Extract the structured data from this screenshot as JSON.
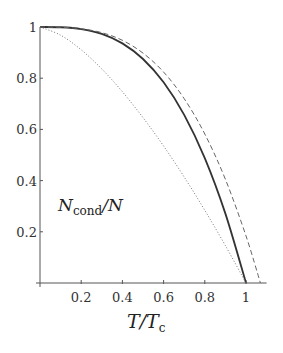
{
  "chart_data": {
    "type": "line",
    "title": "",
    "xlabel": "T/T_c",
    "ylabel": "",
    "annotation": "N_cond/N",
    "xlim": [
      0,
      1.1
    ],
    "ylim": [
      0,
      1
    ],
    "grid": false,
    "legend": null,
    "x_ticks": [
      "0.2",
      "0.4",
      "0.6",
      "0.8",
      "1"
    ],
    "y_ticks": [
      "0.2",
      "0.4",
      "0.6",
      "0.8",
      "1"
    ],
    "series": [
      {
        "name": "solid",
        "style": "solid",
        "color": "#333333",
        "x": [
          0,
          0.1,
          0.2,
          0.3,
          0.4,
          0.5,
          0.6,
          0.7,
          0.8,
          0.9,
          1.0
        ],
        "values": [
          1.0,
          0.999,
          0.992,
          0.973,
          0.936,
          0.875,
          0.784,
          0.657,
          0.488,
          0.271,
          0.0
        ]
      },
      {
        "name": "dashed",
        "style": "dashed",
        "color": "#666666",
        "x": [
          0,
          0.1,
          0.2,
          0.3,
          0.4,
          0.5,
          0.6,
          0.7,
          0.8,
          0.9,
          1.0,
          1.07
        ],
        "values": [
          1.0,
          0.999,
          0.993,
          0.978,
          0.948,
          0.898,
          0.824,
          0.72,
          0.582,
          0.405,
          0.184,
          0.0
        ]
      },
      {
        "name": "dotted",
        "style": "dotted",
        "color": "#777777",
        "x": [
          0,
          0.1,
          0.2,
          0.3,
          0.4,
          0.5,
          0.6,
          0.7,
          0.8,
          0.9,
          1.0
        ],
        "values": [
          1.0,
          0.968,
          0.911,
          0.836,
          0.747,
          0.646,
          0.535,
          0.414,
          0.284,
          0.146,
          0.0
        ]
      }
    ]
  },
  "labels": {
    "annotation_main": "N",
    "annotation_sub": "cond",
    "annotation_tail": "/N",
    "xlabel_main": "T/T",
    "xlabel_sub": "c"
  }
}
